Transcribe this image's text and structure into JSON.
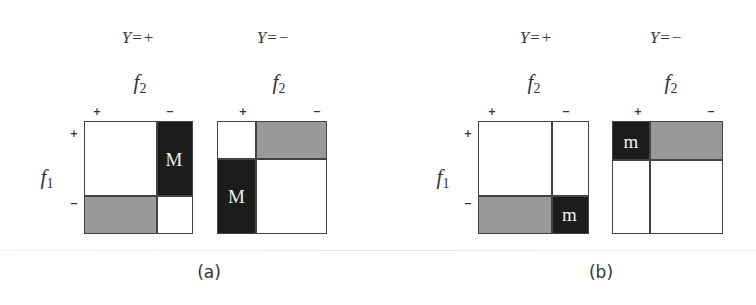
{
  "figure": {
    "panels": [
      {
        "caption": "(a)",
        "row_axis": "f",
        "row_axis_sub": "1",
        "subplots": [
          {
            "condition_var": "Y",
            "condition_eq": "=",
            "condition_val": "+",
            "col_axis": "f",
            "col_axis_sub": "2",
            "col_signs": [
              "+",
              "−"
            ],
            "row_signs": [
              "+",
              "−"
            ],
            "cells": {
              "top_left": {
                "fill": "white",
                "label": ""
              },
              "top_right": {
                "fill": "black",
                "label": "M"
              },
              "bottom_left": {
                "fill": "gray",
                "label": ""
              },
              "bottom_right": {
                "fill": "white",
                "label": ""
              }
            }
          },
          {
            "condition_var": "Y",
            "condition_eq": "=",
            "condition_val": "−",
            "col_axis": "f",
            "col_axis_sub": "2",
            "col_signs": [
              "+",
              "−"
            ],
            "cells": {
              "top_left": {
                "fill": "white",
                "label": ""
              },
              "top_right": {
                "fill": "gray",
                "label": ""
              },
              "bottom_left": {
                "fill": "black",
                "label": "M"
              },
              "bottom_right": {
                "fill": "white",
                "label": ""
              }
            }
          }
        ]
      },
      {
        "caption": "(b)",
        "row_axis": "f",
        "row_axis_sub": "1",
        "subplots": [
          {
            "condition_var": "Y",
            "condition_eq": "=",
            "condition_val": "+",
            "col_axis": "f",
            "col_axis_sub": "2",
            "col_signs": [
              "+",
              "−"
            ],
            "row_signs": [
              "+",
              "−"
            ],
            "cells": {
              "top_left": {
                "fill": "white",
                "label": ""
              },
              "top_right": {
                "fill": "white",
                "label": ""
              },
              "bottom_left": {
                "fill": "gray",
                "label": ""
              },
              "bottom_right": {
                "fill": "black",
                "label": "m"
              }
            }
          },
          {
            "condition_var": "Y",
            "condition_eq": "=",
            "condition_val": "−",
            "col_axis": "f",
            "col_axis_sub": "2",
            "col_signs": [
              "+",
              "−"
            ],
            "cells": {
              "top_left": {
                "fill": "black",
                "label": "m"
              },
              "top_right": {
                "fill": "gray",
                "label": ""
              },
              "bottom_left": {
                "fill": "white",
                "label": ""
              },
              "bottom_right": {
                "fill": "white",
                "label": ""
              }
            }
          }
        ]
      }
    ],
    "colors": {
      "black_cell": "#1c1c1c",
      "gray_cell": "#999999",
      "white_cell": "#ffffff",
      "border": "#444444"
    }
  }
}
